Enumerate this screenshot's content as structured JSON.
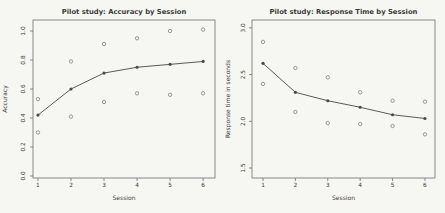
{
  "figure": {
    "background": "#f6f6f2",
    "box_color": "#6f6f6f",
    "text_color": "#3c3c3c",
    "mean_point_color": "#4a4a4a",
    "mean_line_color": "#5a5a5a",
    "open_circle_color": "#8f8f8f"
  },
  "chart_data": [
    {
      "id": "accuracy",
      "type": "line",
      "title": "Pilot study: Accuracy by Session",
      "xlabel": "Session",
      "ylabel": "Accuracy",
      "xticks": [
        "1",
        "2",
        "3",
        "4",
        "5",
        "6"
      ],
      "yticks": [
        "0.0",
        "0.2",
        "0.4",
        "0.6",
        "0.8",
        "1.0"
      ],
      "xlim": [
        0.85,
        6.36
      ],
      "ylim": [
        -0.014,
        1.076
      ],
      "grid": false,
      "legend": "none",
      "series": [
        {
          "name": "mean-accuracy",
          "style": "line-with-filled-points",
          "x": [
            1,
            2,
            3,
            4,
            5,
            6
          ],
          "y": [
            0.42,
            0.6,
            0.71,
            0.75,
            0.77,
            0.79
          ]
        },
        {
          "name": "individual-points",
          "style": "open-circles",
          "points": [
            [
              1,
              0.3
            ],
            [
              1,
              0.53
            ],
            [
              2,
              0.41
            ],
            [
              2,
              0.79
            ],
            [
              3,
              0.51
            ],
            [
              3,
              0.91
            ],
            [
              4,
              0.57
            ],
            [
              4,
              0.95
            ],
            [
              5,
              0.56
            ],
            [
              5,
              1.0
            ],
            [
              6,
              0.57
            ],
            [
              6,
              1.01
            ]
          ]
        }
      ]
    },
    {
      "id": "response-time",
      "type": "line",
      "title": "Pilot study: Response Time by Session",
      "xlabel": "Session",
      "ylabel": "Response time in seconds",
      "xticks": [
        "1",
        "2",
        "3",
        "4",
        "5",
        "6"
      ],
      "yticks": [
        "1.5",
        "2.0",
        "2.5",
        "3.0"
      ],
      "xlim": [
        0.66,
        6.31
      ],
      "ylim": [
        1.393,
        3.084
      ],
      "grid": false,
      "legend": "none",
      "series": [
        {
          "name": "mean-response-time",
          "style": "line-with-filled-points",
          "x": [
            1,
            2,
            3,
            4,
            5,
            6
          ],
          "y": [
            2.62,
            2.31,
            2.22,
            2.15,
            2.07,
            2.03
          ]
        },
        {
          "name": "individual-points",
          "style": "open-circles",
          "points": [
            [
              1,
              2.85
            ],
            [
              1,
              2.4
            ],
            [
              2,
              2.57
            ],
            [
              2,
              2.1
            ],
            [
              3,
              2.47
            ],
            [
              3,
              1.98
            ],
            [
              4,
              2.31
            ],
            [
              4,
              1.97
            ],
            [
              5,
              2.22
            ],
            [
              5,
              1.95
            ],
            [
              6,
              2.21
            ],
            [
              6,
              1.86
            ]
          ]
        }
      ]
    }
  ]
}
